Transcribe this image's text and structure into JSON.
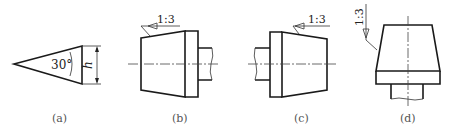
{
  "figure": {
    "panels": [
      {
        "id": "a",
        "caption": "(a)",
        "angle_label": "30°",
        "dimension_label": "h"
      },
      {
        "id": "b",
        "caption": "(b)",
        "taper_label": "1:3"
      },
      {
        "id": "c",
        "caption": "(c)",
        "taper_label": "1:3"
      },
      {
        "id": "d",
        "caption": "(d)",
        "taper_label": "1:3"
      }
    ]
  }
}
